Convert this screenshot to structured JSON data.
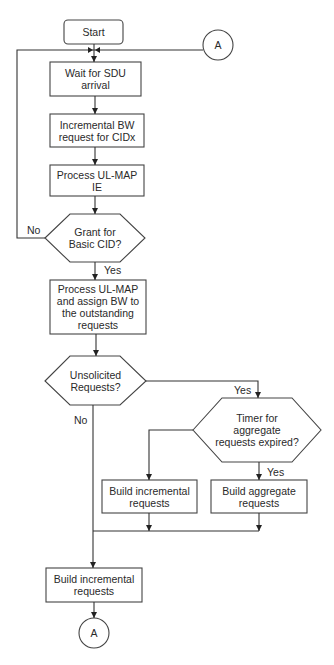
{
  "flowchart": {
    "start": "Start",
    "connector_top": "A",
    "wait": "Wait for SDU\narrival",
    "incremental_bw": "Incremental BW\nrequest for CIDx",
    "process_ie": "Process UL-MAP\nIE",
    "grant_decision": "Grant for\nBasic CID?",
    "grant_no": "No",
    "grant_yes": "Yes",
    "process_assign": "Process UL-MAP\nand assign BW to\nthe outstanding\nrequests",
    "unsolicited_decision": "Unsolicited\nRequests?",
    "unsolicited_yes": "Yes",
    "unsolicited_no": "No",
    "timer_decision": "Timer for\naggregate\nrequests expired?",
    "timer_yes": "Yes",
    "build_incremental_mid": "Build incremental\nrequests",
    "build_aggregate": "Build aggregate\nrequests",
    "build_incremental_final": "Build incremental\nrequests",
    "connector_bottom": "A"
  }
}
